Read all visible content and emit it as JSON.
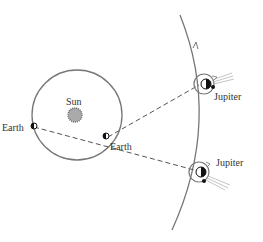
{
  "diagram": {
    "labels": {
      "sun": "Sun",
      "earth_right": "Earth",
      "earth_left": "Earth",
      "jupiter_top": "Jupiter",
      "jupiter_bottom": "Jupiter"
    },
    "colors": {
      "orbit": "#777777",
      "sun_fill": "#aaaaaa",
      "dashed_line": "#555555",
      "planet_dark": "#111111",
      "sunlight_rays": "#aaaaaa"
    }
  }
}
